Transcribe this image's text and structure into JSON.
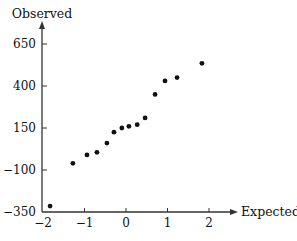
{
  "chart_data": {
    "type": "scatter",
    "title": "",
    "xlabel": "Expected",
    "ylabel": "Observed",
    "x_ticks": [
      -2,
      -1,
      0,
      1,
      2
    ],
    "x_tick_labels": [
      "−2",
      "−1",
      "0",
      "1",
      "2"
    ],
    "y_ticks": [
      -350,
      -100,
      150,
      400,
      650
    ],
    "y_tick_labels": [
      "−350",
      "−100",
      "150",
      "400",
      "650"
    ],
    "xlim": [
      -2,
      2.7
    ],
    "ylim": [
      -350,
      780
    ],
    "grid": false,
    "legend": null,
    "points": [
      {
        "x": -1.83,
        "y": -315
      },
      {
        "x": -1.28,
        "y": -60
      },
      {
        "x": -0.94,
        "y": -10
      },
      {
        "x": -0.7,
        "y": 5
      },
      {
        "x": -0.46,
        "y": 60
      },
      {
        "x": -0.29,
        "y": 125
      },
      {
        "x": -0.1,
        "y": 150
      },
      {
        "x": 0.07,
        "y": 160
      },
      {
        "x": 0.27,
        "y": 170
      },
      {
        "x": 0.46,
        "y": 210
      },
      {
        "x": 0.7,
        "y": 350
      },
      {
        "x": 0.94,
        "y": 430
      },
      {
        "x": 1.23,
        "y": 450
      },
      {
        "x": 1.83,
        "y": 535
      }
    ],
    "point_color": "#111111",
    "axis_color": "#333333"
  }
}
